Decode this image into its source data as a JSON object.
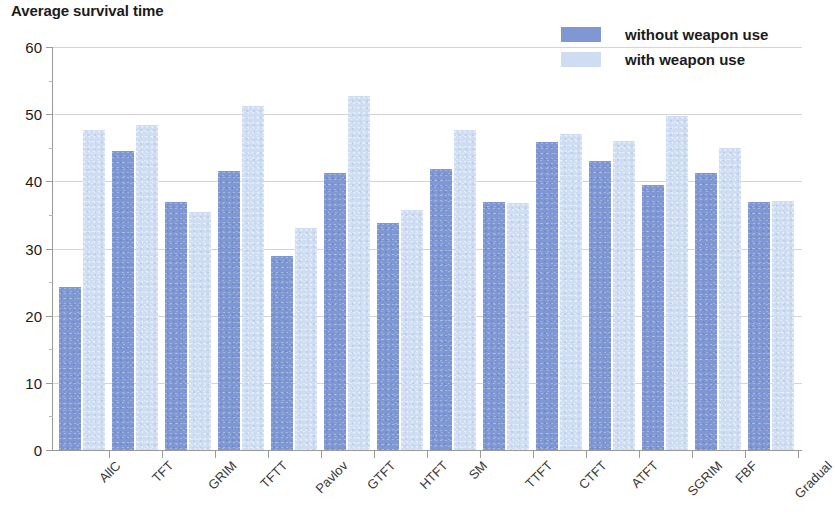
{
  "chart_data": {
    "type": "bar",
    "title": "Average survival time",
    "xlabel": "",
    "ylabel": "",
    "ylim": [
      0,
      60
    ],
    "yticks": [
      0,
      10,
      20,
      30,
      40,
      50,
      60
    ],
    "grid": true,
    "legend_position": "top-right",
    "categories": [
      "AllC",
      "TFT",
      "GRIM",
      "TFTT",
      "Pavlov",
      "GTFT",
      "HTFT",
      "SM",
      "TTFT",
      "CTFT",
      "ATFT",
      "SGRIM",
      "FBF",
      "Gradual"
    ],
    "series": [
      {
        "name": "without weapon use",
        "color": "#7f98d4",
        "values": [
          24.2,
          44.5,
          36.9,
          41.6,
          28.9,
          41.3,
          33.8,
          41.9,
          36.9,
          45.9,
          43.0,
          39.4,
          41.2,
          36.9
        ]
      },
      {
        "name": "with weapon use",
        "color": "#cfddf2",
        "values": [
          47.7,
          48.4,
          35.4,
          51.2,
          33.0,
          52.7,
          35.7,
          47.7,
          36.8,
          47.1,
          46.0,
          49.8,
          45.0,
          37.1
        ]
      }
    ]
  },
  "legend": {
    "items": [
      {
        "label": "without weapon use",
        "color": "#7f98d4"
      },
      {
        "label": "with weapon use",
        "color": "#cfddf2"
      }
    ]
  }
}
